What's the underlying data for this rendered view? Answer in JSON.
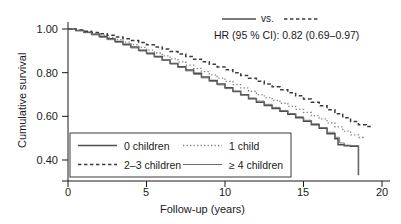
{
  "chart_data": {
    "type": "line",
    "title": "",
    "xlabel": "Follow-up (years)",
    "ylabel": "Cumulative survival",
    "xlim": [
      0,
      20
    ],
    "ylim": [
      0.32,
      1.02
    ],
    "xticks": [
      "0",
      "5",
      "10",
      "15",
      "20"
    ],
    "xtick_values": [
      0,
      5,
      10,
      15,
      20
    ],
    "yticks": [
      "1.00",
      "0.80",
      "0.60",
      "0.40"
    ],
    "ytick_values": [
      1.0,
      0.8,
      0.6,
      0.4
    ],
    "grid": false,
    "legend_position": "lower-left-inside",
    "series": [
      {
        "name": "0 children",
        "style": "solid",
        "width": 1.5,
        "color": "#4d4d4d",
        "x": [
          0,
          0.5,
          1,
          1.5,
          2,
          2.5,
          3,
          3.5,
          4,
          4.5,
          5,
          5.5,
          6,
          6.5,
          7,
          7.5,
          8,
          8.5,
          9,
          9.5,
          10,
          10.5,
          11,
          11.5,
          12,
          12.5,
          13,
          13.5,
          14,
          14.5,
          15,
          15.5,
          16,
          16.5,
          17,
          17.2,
          17.6,
          18,
          18.4,
          18.5
        ],
        "values": [
          1.0,
          0.993,
          0.985,
          0.976,
          0.966,
          0.955,
          0.943,
          0.93,
          0.917,
          0.903,
          0.889,
          0.874,
          0.858,
          0.842,
          0.827,
          0.812,
          0.797,
          0.78,
          0.764,
          0.748,
          0.731,
          0.715,
          0.699,
          0.681,
          0.664,
          0.65,
          0.636,
          0.623,
          0.609,
          0.594,
          0.578,
          0.562,
          0.545,
          0.52,
          0.497,
          0.47,
          0.465,
          0.463,
          0.463,
          0.33
        ]
      },
      {
        "name": "1 child",
        "style": "dotted",
        "width": 1.3,
        "color": "#808080",
        "x": [
          0,
          0.5,
          1,
          1.5,
          2,
          2.5,
          3,
          3.5,
          4,
          4.5,
          5,
          5.5,
          6,
          6.5,
          7,
          7.5,
          8,
          8.5,
          9,
          9.5,
          10,
          10.5,
          11,
          11.5,
          12,
          12.5,
          13,
          13.5,
          14,
          14.5,
          15,
          15.5,
          16,
          16.5,
          17,
          17.5,
          18,
          18.5,
          18.8
        ],
        "values": [
          1.0,
          0.994,
          0.987,
          0.979,
          0.971,
          0.961,
          0.951,
          0.94,
          0.928,
          0.916,
          0.903,
          0.89,
          0.877,
          0.863,
          0.849,
          0.835,
          0.82,
          0.805,
          0.79,
          0.775,
          0.76,
          0.745,
          0.73,
          0.715,
          0.699,
          0.686,
          0.673,
          0.66,
          0.646,
          0.632,
          0.618,
          0.603,
          0.588,
          0.57,
          0.552,
          0.532,
          0.515,
          0.503,
          0.5
        ]
      },
      {
        "name": "2–3 children",
        "style": "dashed",
        "width": 1.5,
        "color": "#3a3a3a",
        "x": [
          0,
          0.5,
          1,
          1.5,
          2,
          2.5,
          3,
          3.5,
          4,
          4.5,
          5,
          5.5,
          6,
          6.5,
          7,
          7.5,
          8,
          8.5,
          9,
          9.5,
          10,
          10.5,
          11,
          11.5,
          12,
          12.5,
          13,
          13.5,
          14,
          14.5,
          15,
          15.5,
          16,
          16.5,
          17,
          17.5,
          18,
          18.5,
          19,
          19.3
        ],
        "values": [
          1.0,
          0.995,
          0.99,
          0.984,
          0.978,
          0.971,
          0.963,
          0.955,
          0.947,
          0.938,
          0.928,
          0.918,
          0.908,
          0.897,
          0.886,
          0.874,
          0.862,
          0.85,
          0.838,
          0.826,
          0.813,
          0.8,
          0.787,
          0.774,
          0.761,
          0.748,
          0.735,
          0.722,
          0.708,
          0.694,
          0.679,
          0.664,
          0.648,
          0.63,
          0.612,
          0.594,
          0.576,
          0.562,
          0.553,
          0.552
        ]
      },
      {
        "name": "≥ 4 children",
        "style": "solid",
        "width": 0.9,
        "color": "#6e6e6e",
        "x": [
          0,
          0.5,
          1,
          1.5,
          2,
          2.5,
          3,
          3.5,
          4,
          4.5,
          5,
          5.5,
          6,
          6.5,
          7,
          7.5,
          8,
          8.5,
          9,
          9.5,
          10,
          10.5,
          11,
          11.5,
          12,
          12.5,
          13,
          13.5,
          14,
          14.5,
          15,
          15.5,
          16,
          16.5,
          17,
          17.3,
          17.6,
          18,
          18.3,
          18.5
        ],
        "values": [
          1.0,
          0.992,
          0.983,
          0.973,
          0.962,
          0.951,
          0.939,
          0.926,
          0.913,
          0.899,
          0.885,
          0.871,
          0.856,
          0.84,
          0.824,
          0.808,
          0.792,
          0.776,
          0.76,
          0.744,
          0.727,
          0.712,
          0.697,
          0.684,
          0.67,
          0.655,
          0.641,
          0.627,
          0.613,
          0.598,
          0.582,
          0.566,
          0.549,
          0.527,
          0.504,
          0.478,
          0.468,
          0.466,
          0.466,
          0.335
        ]
      }
    ],
    "annotations": [
      {
        "name": "comparison-note",
        "text": "vs."
      },
      {
        "name": "hazard-ratio-note",
        "text": "HR (95 % CI): 0.82 (0.69–0.97)"
      }
    ]
  },
  "legend": {
    "items": [
      {
        "label": "0 children",
        "style": "solid"
      },
      {
        "label": "1 child",
        "style": "dotted"
      },
      {
        "label": "2–3 children",
        "style": "dashed"
      },
      {
        "label": "≥ 4 children",
        "style": "solid-thin"
      }
    ]
  },
  "colors": {
    "axis": "#1a1a1a",
    "text": "#1a1a1a",
    "curve_0_children": "#4d4d4d",
    "curve_1_child": "#808080",
    "curve_2_3_children": "#3a3a3a",
    "curve_4plus_children": "#6e6e6e"
  }
}
